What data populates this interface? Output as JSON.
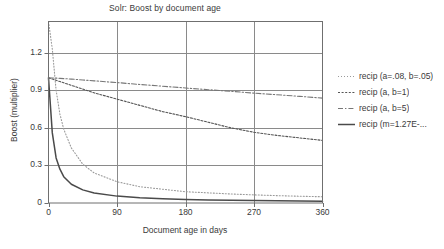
{
  "chart_data": {
    "type": "line",
    "title": "Solr: Boost by document age",
    "xlabel": "Document age in days",
    "ylabel": "Boost (multiplier)",
    "xlim": [
      0,
      360
    ],
    "ylim": [
      0,
      1.45
    ],
    "grid": true,
    "legend_position": "right",
    "xticks": [
      "0",
      "90",
      "180",
      "270",
      "360"
    ],
    "xtick_values": [
      0,
      90,
      180,
      270,
      360
    ],
    "yticks": [
      "0",
      "0.3",
      "0.6",
      "0.9",
      "1.2"
    ],
    "ytick_values": [
      0,
      0.3,
      0.6,
      0.9,
      1.2
    ],
    "x": [
      0,
      5,
      10,
      15,
      20,
      30,
      45,
      60,
      90,
      120,
      150,
      180,
      210,
      240,
      270,
      300,
      330,
      360
    ],
    "series": [
      {
        "name": "recip (a=.08, b=.05)",
        "style": "dotted-light",
        "color": "#9a9a9a",
        "values": [
          1.45,
          1.23,
          0.9,
          0.71,
          0.59,
          0.44,
          0.31,
          0.24,
          0.17,
          0.13,
          0.11,
          0.09,
          0.081,
          0.072,
          0.065,
          0.059,
          0.054,
          0.05
        ]
      },
      {
        "name": "recip (a, b=1)",
        "style": "dotted-dense",
        "color": "#555555",
        "values": [
          1.0,
          0.99,
          0.98,
          0.97,
          0.96,
          0.94,
          0.91,
          0.88,
          0.83,
          0.78,
          0.73,
          0.69,
          0.645,
          0.6,
          0.565,
          0.54,
          0.52,
          0.5
        ]
      },
      {
        "name": "recip (a, b=5)",
        "style": "dash-dot",
        "color": "#777777",
        "values": [
          1.0,
          0.999,
          0.998,
          0.996,
          0.994,
          0.99,
          0.983,
          0.976,
          0.962,
          0.947,
          0.933,
          0.919,
          0.905,
          0.892,
          0.878,
          0.865,
          0.852,
          0.838
        ]
      },
      {
        "name": "recip (m=1.27E-...",
        "style": "solid",
        "color": "#4a4a4a",
        "values": [
          1.0,
          0.56,
          0.36,
          0.27,
          0.21,
          0.15,
          0.105,
          0.08,
          0.055,
          0.042,
          0.034,
          0.028,
          0.024,
          0.021,
          0.019,
          0.017,
          0.015,
          0.014
        ]
      }
    ]
  }
}
